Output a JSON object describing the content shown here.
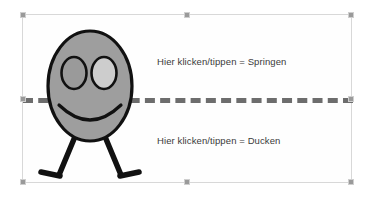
{
  "canvas": {
    "width": 374,
    "height": 199,
    "background_color": "#ffffff"
  },
  "selection": {
    "name": "selected-graphic-frame",
    "border_color": "#d8d8d8",
    "handle_color": "#9a9a9a",
    "handles": [
      {
        "id": "top-left",
        "position": "tl"
      },
      {
        "id": "top-center",
        "position": "tc"
      },
      {
        "id": "top-right",
        "position": "tr"
      },
      {
        "id": "middle-left",
        "position": "ml"
      },
      {
        "id": "middle-right",
        "position": "mr"
      },
      {
        "id": "bottom-left",
        "position": "bl"
      },
      {
        "id": "bottom-center",
        "position": "bc"
      },
      {
        "id": "bottom-right",
        "position": "br"
      }
    ]
  },
  "divider": {
    "style": "dashed",
    "color": "#6d6d6d",
    "thickness_px": 5
  },
  "zones": {
    "upper": {
      "label": "Hier klicken/tippen = Springen",
      "action": "Springen"
    },
    "lower": {
      "label": "Hier klicken/tippen = Ducken",
      "action": "Ducken"
    }
  },
  "figure": {
    "name": "stick-figure-character",
    "body_fill": "#9e9e9e",
    "body_stroke": "#111111",
    "eye_left_fill": "#9a9a9a",
    "eye_right_fill": "#c9c9c9",
    "limb_color": "#111111",
    "parts": [
      "body-ellipse",
      "eye-left",
      "eye-right",
      "smile",
      "leg-left",
      "leg-right",
      "foot-left",
      "foot-right"
    ]
  },
  "text_color": "#3a3a3a"
}
